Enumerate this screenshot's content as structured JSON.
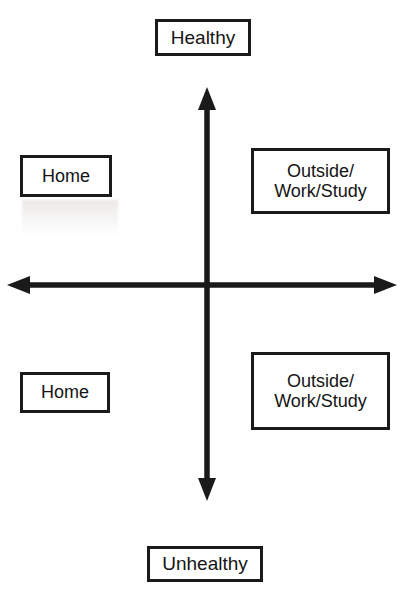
{
  "diagram": {
    "type": "2x2-quadrant",
    "background_color": "#ffffff",
    "line_color": "#1a1a1a",
    "text_color": "#141414",
    "axes": {
      "vertical": {
        "name": "health-axis",
        "top_label": "Healthy",
        "bottom_label": "Unhealthy",
        "double_headed": true
      },
      "horizontal": {
        "name": "location-axis",
        "left_label": "",
        "right_label": "",
        "double_headed": true
      }
    },
    "axis_labels": {
      "top": "Healthy",
      "bottom": "Unhealthy"
    },
    "quadrants": {
      "upper_left": "Home",
      "upper_right": "Outside/\nWork/Study",
      "lower_left": "Home",
      "lower_right": "Outside/\nWork/Study"
    }
  }
}
